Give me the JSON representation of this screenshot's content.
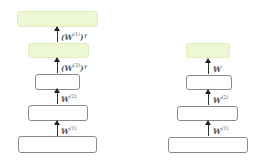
{
  "diagrams": [
    {
      "name": "autoencoder-tied",
      "layers": [
        {
          "style": "green"
        },
        {
          "style": "green"
        },
        {
          "style": "plain"
        },
        {
          "style": "plain"
        },
        {
          "style": "plain"
        }
      ],
      "edges": [
        {
          "base": "(W",
          "sup": "(1)",
          "tail": ")ᵀ"
        },
        {
          "base": "(W",
          "sup": "(2)",
          "tail": ")ᵀ"
        },
        {
          "base": "W",
          "sup": "(2)",
          "tail": ""
        },
        {
          "base": "W",
          "sup": "(1)",
          "tail": ""
        }
      ]
    },
    {
      "name": "classifier",
      "layers": [
        {
          "style": "green"
        },
        {
          "style": "plain"
        },
        {
          "style": "plain"
        },
        {
          "style": "plain"
        }
      ],
      "edges": [
        {
          "base": "W",
          "sup": "",
          "tail": ""
        },
        {
          "base": "W",
          "sup": "(2)",
          "tail": ""
        },
        {
          "base": "W",
          "sup": "(1)",
          "tail": ""
        }
      ]
    }
  ],
  "colors": {
    "output_layer": "#eef7d4",
    "border": "#8a8a8a"
  }
}
